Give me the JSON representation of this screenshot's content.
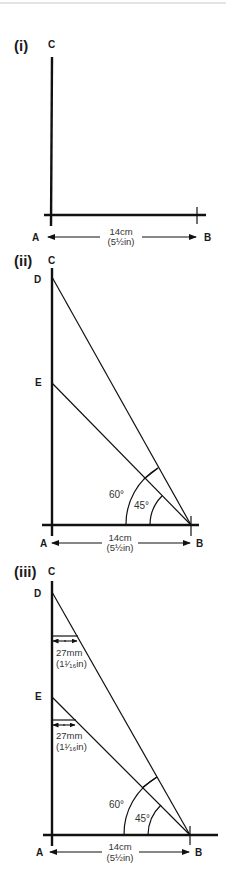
{
  "top_rule_color": "#c8c8c8",
  "diagrams": [
    {
      "step": "(i)",
      "points": {
        "A": "A",
        "B": "B",
        "C": "C"
      },
      "measure": {
        "metric": "14cm",
        "imperial": "(5½in)"
      }
    },
    {
      "step": "(ii)",
      "points": {
        "A": "A",
        "B": "B",
        "C": "C",
        "D": "D",
        "E": "E"
      },
      "measure": {
        "metric": "14cm",
        "imperial": "(5½in)"
      },
      "angles": {
        "large": "60°",
        "small": "45°"
      }
    },
    {
      "step": "(iii)",
      "points": {
        "A": "A",
        "B": "B",
        "C": "C",
        "D": "D",
        "E": "E"
      },
      "measure": {
        "metric": "14cm",
        "imperial": "(5½in)"
      },
      "angles": {
        "large": "60°",
        "small": "45°"
      },
      "offsets": [
        {
          "metric": "27mm",
          "imperial": "(1¹⁄₁₆in)"
        },
        {
          "metric": "27mm",
          "imperial": "(1¹⁄₁₆in)"
        }
      ]
    }
  ]
}
